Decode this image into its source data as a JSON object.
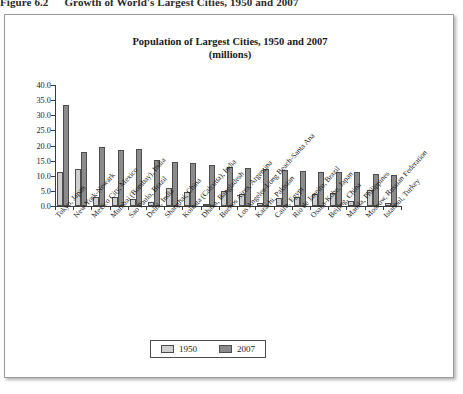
{
  "figure": {
    "number": "Figure 6.2",
    "caption": "Growth of World's Largest Cities, 1950 and 2007"
  },
  "colors": {
    "series_1950": "#cfcfcf",
    "series_2007": "#8b8b8b",
    "axis": "#3b3b3b",
    "panel_border": "#9a9a9a",
    "background": "#ffffff"
  },
  "legend": {
    "items": [
      {
        "label": "1950",
        "color": "#cfcfcf"
      },
      {
        "label": "2007",
        "color": "#8b8b8b"
      }
    ]
  },
  "chart_data": {
    "type": "bar",
    "title": "Population of Largest Cities, 1950 and 2007",
    "subtitle": "(millions)",
    "xlabel": "",
    "ylabel": "",
    "ylim": [
      0.0,
      40.0
    ],
    "ytick_labels": [
      "0.0",
      "5.0",
      "10.0",
      "15.0",
      "20.0",
      "25.0",
      "30.0",
      "35.0",
      "40.0"
    ],
    "ytick_values": [
      0,
      5,
      10,
      15,
      20,
      25,
      30,
      35,
      40
    ],
    "grid": false,
    "legend_position": "bottom-center",
    "categories": [
      "Tokyo, Japan",
      "New York-Newark",
      "Mexico City, Mexico",
      "Mumbai (Bombay), India",
      "Sao Paulo, Brazil",
      "Delhi, India",
      "Shanghai, China",
      "Kolkata (Calcutta), India",
      "Dhaka, Bangladesh",
      "Buenos Aires, Argentina",
      "Los Angeles-Long Beach-Santa Ana",
      "Karachi, Pakistan",
      "Cairo, Egypt",
      "Rio de Janeiro, Brazil",
      "Osaka-Kobe, Japan",
      "Beijing, China",
      "Manila, Philippines",
      "Moscow, Russian Federation",
      "Istanbul, Turkey"
    ],
    "series": [
      {
        "name": "1950",
        "values": [
          11.3,
          12.3,
          2.9,
          2.9,
          2.3,
          1.4,
          6.1,
          4.5,
          0.3,
          5.1,
          4.0,
          1.1,
          2.5,
          2.9,
          4.1,
          4.3,
          1.5,
          5.4,
          1.0
        ]
      },
      {
        "name": "2007",
        "values": [
          33.3,
          17.8,
          19.4,
          18.6,
          18.8,
          15.1,
          14.5,
          14.1,
          13.5,
          12.8,
          12.5,
          12.1,
          11.9,
          11.7,
          11.3,
          11.1,
          11.1,
          10.5,
          10.1
        ]
      }
    ]
  }
}
